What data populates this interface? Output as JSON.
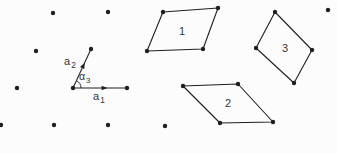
{
  "figure": {
    "canvas": {
      "width": 337,
      "height": 153,
      "background": "#fcfcfc"
    },
    "ink_color": "#1f1f1f",
    "label_color": "#333333",
    "dot_radius": 2.2,
    "line_width": 1.1,
    "lattice_dots": [
      [
        53,
        13
      ],
      [
        108,
        12
      ],
      [
        163,
        12
      ],
      [
        218,
        8
      ],
      [
        275,
        12
      ],
      [
        328,
        10
      ],
      [
        36,
        51
      ],
      [
        91,
        49
      ],
      [
        147,
        51
      ],
      [
        203,
        49
      ],
      [
        256,
        48
      ],
      [
        312,
        50
      ],
      [
        17,
        88
      ],
      [
        73,
        88
      ],
      [
        127,
        88
      ],
      [
        183,
        86
      ],
      [
        238,
        84
      ],
      [
        294,
        83
      ],
      [
        1,
        125
      ],
      [
        54,
        125
      ],
      [
        108,
        125
      ],
      [
        165,
        126
      ],
      [
        220,
        123
      ],
      [
        273,
        122
      ]
    ],
    "unit_cells": [
      {
        "label": "1",
        "vertices": [
          [
            163,
            12
          ],
          [
            218,
            8
          ],
          [
            203,
            49
          ],
          [
            147,
            51
          ]
        ],
        "label_pos": [
          182,
          35
        ]
      },
      {
        "label": "2",
        "vertices": [
          [
            183,
            86
          ],
          [
            238,
            84
          ],
          [
            273,
            122
          ],
          [
            220,
            123
          ]
        ],
        "label_pos": [
          228,
          107
        ]
      },
      {
        "label": "3",
        "vertices": [
          [
            275,
            12
          ],
          [
            312,
            50
          ],
          [
            294,
            83
          ],
          [
            256,
            48
          ]
        ],
        "label_pos": [
          285,
          52
        ]
      }
    ],
    "basis_vectors": [
      {
        "base": "a",
        "sub": "1",
        "from": [
          73,
          88
        ],
        "to": [
          127,
          88
        ],
        "arrow_at": 0.56,
        "label_pos": [
          93,
          100
        ]
      },
      {
        "base": "a",
        "sub": "2",
        "from": [
          73,
          88
        ],
        "to": [
          91,
          49
        ],
        "arrow_at": 0.55,
        "label_pos": [
          64,
          65
        ]
      }
    ],
    "angle_mark": {
      "base": "α",
      "sub": "3",
      "vertex": [
        73,
        88
      ],
      "radius": 8,
      "from_deg": 0,
      "to_deg": -65,
      "label_pos": [
        79,
        80
      ]
    }
  }
}
